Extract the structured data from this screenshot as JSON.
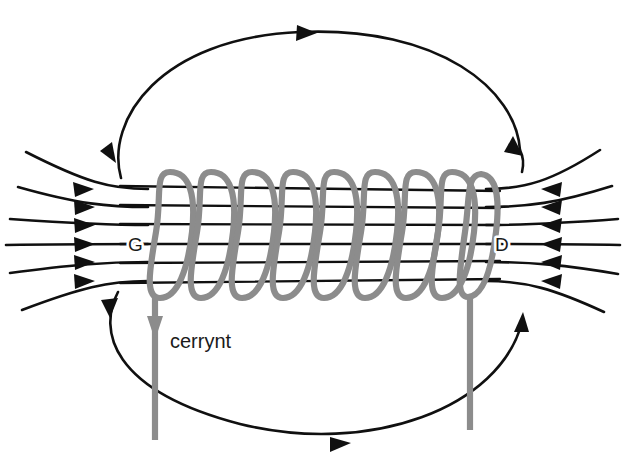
{
  "figure": {
    "type": "physics-diagram",
    "background_color": "#ffffff",
    "width": 624,
    "height": 462
  },
  "labels": {
    "left_pole": "G",
    "right_pole": "D",
    "current": "cerrynt"
  },
  "colors": {
    "field_line": "#101010",
    "coil_wire": "#8c8c8c",
    "lead_wire": "#8c8c8c",
    "background": "#ffffff",
    "text": "#1a1a1a"
  },
  "solenoid": {
    "turns": 9,
    "x_start": 150,
    "x_end": 481,
    "y_top": 170,
    "y_bottom": 300,
    "turn_pitch": 41.4
  },
  "core_field_lines": {
    "count": 6,
    "direction": "right-to-left",
    "y_positions": [
      188,
      206,
      224,
      243,
      262,
      281
    ]
  },
  "external_field_lines": {
    "left_fan_count": 6,
    "right_fan_count": 6,
    "arrow_direction": "left"
  },
  "return_loops": {
    "top": {
      "arrows": [
        "top-center-right",
        "right-descending",
        "left-descending"
      ]
    },
    "bottom": {
      "arrows": [
        "left-descending",
        "bottom-center-right",
        "right-ascending"
      ]
    }
  },
  "leads": {
    "left": {
      "x": 155,
      "y_start": 296,
      "y_end": 440,
      "has_arrow": true,
      "arrow_direction": "down",
      "arrow_y": 330
    },
    "right": {
      "x": 470,
      "y_start": 296,
      "y_end": 430,
      "has_arrow": false
    }
  }
}
